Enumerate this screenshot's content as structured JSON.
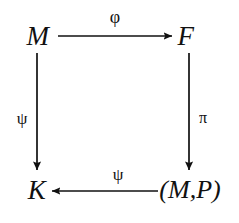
{
  "diagram": {
    "kind": "commutative-diagram",
    "shape": "square",
    "background_color": "#ffffff",
    "ink_color": "#111111",
    "nodes": [
      {
        "id": "top-left",
        "label": "M",
        "x": 38,
        "y": 36
      },
      {
        "id": "top-right",
        "label": "F",
        "x": 186,
        "y": 36
      },
      {
        "id": "bottom-left",
        "label": "K",
        "x": 37,
        "y": 190
      },
      {
        "id": "bottom-right",
        "label": "(M,P)",
        "x": 190,
        "y": 190
      }
    ],
    "edges": [
      {
        "id": "top-edge",
        "from": "M",
        "to": "F",
        "label": "φ",
        "label_name": "phi",
        "direction": "right",
        "x1": 58,
        "y1": 36,
        "x2": 172,
        "y2": 36,
        "label_x": 115,
        "label_y": 17
      },
      {
        "id": "left-edge",
        "from": "M",
        "to": "K",
        "label": "ψ",
        "label_name": "psi",
        "direction": "down",
        "x1": 37,
        "y1": 53,
        "x2": 37,
        "y2": 170,
        "label_x": 22,
        "label_y": 118
      },
      {
        "id": "right-edge",
        "from": "F",
        "to": "(M,P)",
        "label": "π",
        "label_name": "pi",
        "direction": "down",
        "x1": 189,
        "y1": 53,
        "x2": 189,
        "y2": 170,
        "label_x": 203,
        "label_y": 118
      },
      {
        "id": "bottom-edge",
        "from": "(M,P)",
        "to": "K",
        "label": "ψ",
        "label_name": "psi",
        "direction": "left",
        "x1": 158,
        "y1": 191,
        "x2": 52,
        "y2": 191,
        "label_x": 118,
        "label_y": 174
      }
    ]
  }
}
